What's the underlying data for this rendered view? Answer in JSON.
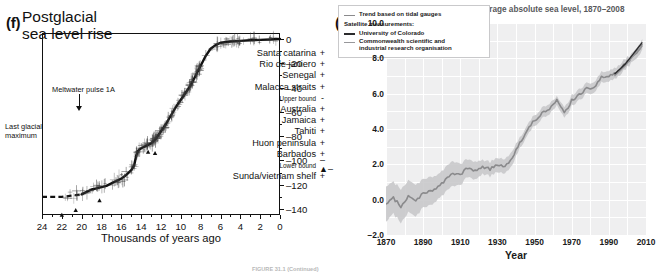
{
  "figure": {
    "caption": "FIGURE 31.1 (Continued)"
  },
  "panel_f": {
    "tag": "(f)",
    "title_line1": "Postglacial",
    "title_line2": "sea level rise",
    "annotations": {
      "meltwater": "Meltwater pulse 1A",
      "lgm_line1": "Last glacial",
      "lgm_line2": "maximum"
    },
    "legend": [
      {
        "label": "Santa catarina",
        "symbol": "+",
        "size": "normal"
      },
      {
        "label": "Rio de janiero",
        "symbol": "+",
        "size": "normal"
      },
      {
        "label": "Senegal",
        "symbol": "+",
        "size": "normal"
      },
      {
        "label": "Malacca straits",
        "symbol": "+",
        "size": "normal"
      },
      {
        "label": "Upper bound",
        "symbol": "-",
        "size": "small"
      },
      {
        "label": "Australia",
        "symbol": "+",
        "size": "normal"
      },
      {
        "label": "Jamaica",
        "symbol": "+",
        "size": "normal"
      },
      {
        "label": "Tahiti",
        "symbol": "+",
        "size": "normal"
      },
      {
        "label": "Huon peninsula",
        "symbol": "+",
        "size": "normal"
      },
      {
        "label": "Barbados",
        "symbol": "+",
        "size": "normal"
      },
      {
        "label": "Lower bound",
        "symbol": "–▲–",
        "size": "small"
      },
      {
        "label": "Sunda/vietnam shelf",
        "symbol": "+",
        "size": "normal"
      }
    ],
    "xlabel": "Thousands of years ago",
    "ylabel": "Sea level change (m)",
    "xticks": [
      24,
      22,
      20,
      18,
      16,
      14,
      12,
      10,
      8,
      6,
      4,
      2,
      0
    ],
    "yticks": [
      0,
      -20,
      -40,
      -60,
      -80,
      -100,
      -120,
      -140
    ]
  },
  "panel_g": {
    "tag": "(g)",
    "title": "Trends in global average absolute sea level, 1870–2008",
    "xlabel": "Year",
    "ylabel": "Change in sea level (inches)",
    "xticks": [
      1870,
      1890,
      1910,
      1930,
      1950,
      1970,
      1990,
      2010
    ],
    "yticks": [
      "10.0",
      "8.0",
      "6.0",
      "4.0",
      "2.0",
      "0.0",
      "−2.0"
    ],
    "legend": {
      "tidal": "Trend based on tidal gauges",
      "satellite_header": "Satellite measurements:",
      "colorado": "University of Colorado",
      "csiro_line1": "Commonwealth scientific and",
      "csiro_line2": "industrial research organisation"
    },
    "colors": {
      "plot_background": "#efeff0",
      "gridline": "#ffffff",
      "tidal_line": "#8a8a8c",
      "tidal_band": "#c6c6c8",
      "colorado_line": "#2b2b2d",
      "csiro_line": "#97979a",
      "text": "#1a1a1a",
      "title_text": "#58595b"
    }
  },
  "chart_data": [
    {
      "type": "line",
      "title": "Postglacial sea level rise",
      "xlabel": "Thousands of years ago",
      "ylabel": "Sea level change (m)",
      "xlim": [
        24,
        0
      ],
      "ylim": [
        -145,
        5
      ],
      "grid": false,
      "legend_position": "inside-right",
      "x_reversed": true,
      "annotations": [
        "Meltwater pulse 1A at ~14.5 ka",
        "Last glacial maximum at ~22-20 ka"
      ],
      "series": [
        {
          "name": "Sea level curve",
          "x": [
            24,
            23,
            22,
            21,
            20,
            19.5,
            19,
            18.5,
            18,
            17.5,
            17,
            16.5,
            16,
            15.5,
            15,
            14.7,
            14.5,
            14.3,
            14,
            13.5,
            13,
            12.5,
            12,
            11.5,
            11,
            10.5,
            10,
            9.5,
            9,
            8.5,
            8,
            7.5,
            7,
            6.5,
            6,
            5,
            4,
            3,
            2,
            1,
            0
          ],
          "y": [
            -130,
            -130,
            -130,
            -129,
            -128,
            -126,
            -124,
            -123,
            -122,
            -121,
            -119,
            -117,
            -115,
            -112,
            -108,
            -104,
            -96,
            -92,
            -90,
            -88,
            -86,
            -82,
            -76,
            -70,
            -63,
            -56,
            -50,
            -44,
            -38,
            -30,
            -22,
            -14,
            -8,
            -5,
            -3,
            -2,
            -1.5,
            -1,
            -0.7,
            -0.3,
            0
          ]
        }
      ]
    },
    {
      "type": "line",
      "title": "Trends in global average absolute sea level, 1870–2008",
      "xlabel": "Year",
      "ylabel": "Change in sea level (inches)",
      "xlim": [
        1870,
        2010
      ],
      "ylim": [
        -2.0,
        10.0
      ],
      "grid": true,
      "legend_position": "top-left",
      "series": [
        {
          "name": "Trend based on tidal gauges",
          "x": [
            1870,
            1874,
            1878,
            1882,
            1886,
            1890,
            1894,
            1898,
            1902,
            1906,
            1910,
            1914,
            1918,
            1922,
            1926,
            1930,
            1934,
            1938,
            1942,
            1946,
            1950,
            1954,
            1958,
            1962,
            1966,
            1970,
            1974,
            1978,
            1982,
            1986,
            1990,
            1994,
            1998,
            2002,
            2006,
            2008
          ],
          "y": [
            -0.3,
            0.1,
            -0.4,
            0.2,
            -0.1,
            0.4,
            0.5,
            0.7,
            1.1,
            1.5,
            1.4,
            1.8,
            1.6,
            1.9,
            1.7,
            2.0,
            1.9,
            2.4,
            3.2,
            3.9,
            4.5,
            4.9,
            5.1,
            5.6,
            4.9,
            5.6,
            5.9,
            6.3,
            6.4,
            6.9,
            7.0,
            7.2,
            7.6,
            8.0,
            8.5,
            8.8
          ],
          "upper_band": [
            0.7,
            1.0,
            0.6,
            1.1,
            0.8,
            1.2,
            1.3,
            1.4,
            1.8,
            2.2,
            2.0,
            2.3,
            2.1,
            2.3,
            2.1,
            2.4,
            2.3,
            2.8,
            3.5,
            4.2,
            4.8,
            5.2,
            5.4,
            5.8,
            5.2,
            5.9,
            6.2,
            6.6,
            6.7,
            7.2,
            7.3,
            7.5,
            7.9,
            8.2,
            8.8,
            9.1
          ],
          "lower_band": [
            -1.3,
            -0.8,
            -1.3,
            -0.7,
            -1.0,
            -0.4,
            -0.3,
            0.0,
            0.4,
            0.8,
            0.8,
            1.3,
            1.1,
            1.5,
            1.3,
            1.6,
            1.5,
            2.0,
            2.9,
            3.6,
            4.2,
            4.6,
            4.8,
            5.3,
            4.6,
            5.3,
            5.6,
            6.0,
            6.1,
            6.6,
            6.7,
            6.9,
            7.3,
            7.7,
            8.2,
            8.5
          ]
        },
        {
          "name": "University of Colorado",
          "x": [
            1993,
            1996,
            1999,
            2002,
            2005,
            2008
          ],
          "y": [
            7.1,
            7.4,
            7.7,
            8.1,
            8.5,
            8.9
          ]
        },
        {
          "name": "Commonwealth scientific and industrial research organisation",
          "x": [
            1993,
            1996,
            1999,
            2002,
            2005,
            2008
          ],
          "y": [
            7.0,
            7.3,
            7.6,
            8.0,
            8.4,
            8.7
          ]
        }
      ]
    }
  ]
}
